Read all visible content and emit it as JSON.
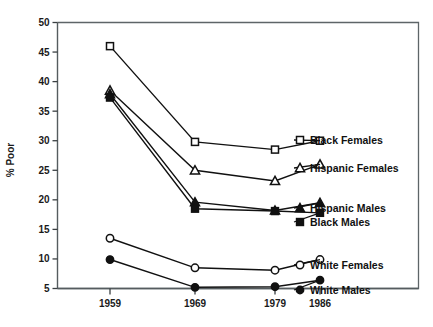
{
  "chart_data": {
    "type": "line",
    "title": "",
    "xlabel": "",
    "ylabel": "% Poor",
    "x": [
      "1959",
      "1969",
      "1979",
      "1986"
    ],
    "xtick_labels": [
      "1959",
      "1969",
      "1979",
      "1986"
    ],
    "ytick_labels": [
      "5",
      "10",
      "15",
      "20",
      "25",
      "30",
      "35",
      "40",
      "45",
      "50"
    ],
    "ylim": [
      5,
      50
    ],
    "ytick_step": 5,
    "grid": false,
    "legend_position": "right-inline",
    "series": [
      {
        "name": "Black Females",
        "marker": "open-square",
        "values": [
          46.0,
          29.8,
          28.5,
          30.0
        ]
      },
      {
        "name": "Hispanic Females",
        "marker": "open-triangle",
        "values": [
          38.5,
          25.0,
          23.2,
          26.0
        ]
      },
      {
        "name": "Hispanic Males",
        "marker": "filled-triangle",
        "values": [
          37.9,
          19.6,
          18.2,
          19.5
        ]
      },
      {
        "name": "Black Males",
        "marker": "filled-square",
        "values": [
          37.3,
          18.5,
          18.1,
          17.8
        ]
      },
      {
        "name": "White Females",
        "marker": "open-circle",
        "values": [
          13.5,
          8.5,
          8.1,
          9.9
        ]
      },
      {
        "name": "White Males",
        "marker": "filled-circle",
        "values": [
          9.9,
          5.2,
          5.3,
          6.4
        ]
      }
    ]
  },
  "legend": {
    "items": [
      {
        "label": "Black Females"
      },
      {
        "label": "Hispanic Females"
      },
      {
        "label": "Hispanic Males"
      },
      {
        "label": "Black Males"
      },
      {
        "label": "White Females"
      },
      {
        "label": "White Males"
      }
    ]
  },
  "axis": {
    "y_title": "% Poor"
  }
}
